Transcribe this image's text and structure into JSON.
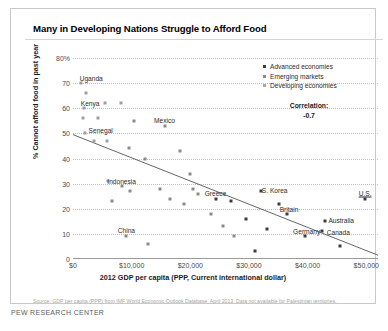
{
  "title": "Many in Developing Nations Struggle to Afford Food",
  "legend": {
    "position": "top-right",
    "items": [
      {
        "key": "adv",
        "label": "Advanced economies"
      },
      {
        "key": "eme",
        "label": "Emerging markets"
      },
      {
        "key": "dev",
        "label": "Developing economies"
      }
    ]
  },
  "annotation": {
    "correlation_label": "Correlation:",
    "correlation_value": "-0.7"
  },
  "source": "Source: GDP per capita (PPP) from IMF World Economic Outlook Database, April 2013. Data not available for Palestinian territories.",
  "footer": "PEW RESEARCH CENTER",
  "colors": {
    "advanced": "#3d3d3d",
    "emerging": "#8a8a8a",
    "developing": "#9e9e9e",
    "gridline": "#c0c0c0",
    "axis": "#9a9a9a",
    "trendline": "#555555",
    "title_text": "#000000",
    "source_text": "#a6a6a6"
  },
  "chart_data": {
    "type": "scatter",
    "title": "Many in Developing Nations Struggle to Afford Food",
    "xlabel": "2012 GDP per capita (PPP, Current international dollar)",
    "ylabel": "% Cannot afford food in past year",
    "xlim": [
      0,
      52000
    ],
    "ylim": [
      0,
      80
    ],
    "grid": true,
    "xticks": [
      0,
      10000,
      20000,
      30000,
      40000,
      50000
    ],
    "xticklabels": [
      "$0",
      "$10,000",
      "$20,000",
      "$30,000",
      "$40,000",
      "$50,000"
    ],
    "yticks": [
      0,
      10,
      20,
      30,
      40,
      50,
      60,
      70,
      80
    ],
    "yticklabels": [
      "0",
      "10",
      "20",
      "30",
      "40",
      "50",
      "60",
      "70",
      "80%"
    ],
    "annotations": [
      {
        "text": "Correlation:",
        "x": 44000,
        "y": 63
      },
      {
        "text": "-0.7",
        "x": 44000,
        "y": 58
      }
    ],
    "trendline": {
      "x0": 0,
      "y0": 49.5,
      "x1": 52000,
      "y1": 1.5,
      "correlation": -0.7
    },
    "series": [
      {
        "name": "Developing economies",
        "color": "#9e9e9e",
        "points": [
          {
            "label": "Uganda",
            "x": 1400,
            "y": 70,
            "label_dx": 10,
            "label_dy": 5
          },
          {
            "label": "",
            "x": 2300,
            "y": 66
          },
          {
            "label": "Kenya",
            "x": 1900,
            "y": 60,
            "label_dx": 6,
            "label_dy": 5
          },
          {
            "label": "",
            "x": 5400,
            "y": 62
          },
          {
            "label": "",
            "x": 8200,
            "y": 62
          },
          {
            "label": "",
            "x": 1700,
            "y": 56
          },
          {
            "label": "",
            "x": 4200,
            "y": 56
          },
          {
            "label": "Senegal",
            "x": 2000,
            "y": 50,
            "label_dx": 16,
            "label_dy": 3
          },
          {
            "label": "",
            "x": 3500,
            "y": 47
          },
          {
            "label": "",
            "x": 5800,
            "y": 47
          },
          {
            "label": "",
            "x": 5900,
            "y": 31
          }
        ]
      },
      {
        "name": "Emerging markets",
        "color": "#8a8a8a",
        "points": [
          {
            "label": "Mexico",
            "x": 15600,
            "y": 53,
            "label_dx": 0,
            "label_dy": 6
          },
          {
            "label": "",
            "x": 10400,
            "y": 55
          },
          {
            "label": "",
            "x": 9500,
            "y": 44
          },
          {
            "label": "",
            "x": 12200,
            "y": 40
          },
          {
            "label": "",
            "x": 18300,
            "y": 43
          },
          {
            "label": "",
            "x": 20000,
            "y": 34
          },
          {
            "label": "Indonesia",
            "x": 8300,
            "y": 29,
            "label_dx": 0,
            "label_dy": 5
          },
          {
            "label": "",
            "x": 9700,
            "y": 27
          },
          {
            "label": "",
            "x": 14800,
            "y": 28
          },
          {
            "label": "",
            "x": 20400,
            "y": 28
          },
          {
            "label": "",
            "x": 21300,
            "y": 26
          },
          {
            "label": "",
            "x": 19000,
            "y": 22
          },
          {
            "label": "",
            "x": 16600,
            "y": 24
          },
          {
            "label": "",
            "x": 6700,
            "y": 23
          },
          {
            "label": "China",
            "x": 9100,
            "y": 9,
            "label_dx": 0,
            "label_dy": 6
          },
          {
            "label": "",
            "x": 12800,
            "y": 6
          },
          {
            "label": "",
            "x": 23500,
            "y": 18
          },
          {
            "label": "",
            "x": 25500,
            "y": 13
          },
          {
            "label": "",
            "x": 27500,
            "y": 9
          }
        ]
      },
      {
        "name": "Advanced economies",
        "color": "#3d3d3d",
        "points": [
          {
            "label": "Greece",
            "x": 24300,
            "y": 24,
            "label_dx": 0,
            "label_dy": 6
          },
          {
            "label": "",
            "x": 27000,
            "y": 23
          },
          {
            "label": "S. Korea",
            "x": 32000,
            "y": 27,
            "label_dx": 14,
            "label_dy": 1
          },
          {
            "label": "Britain",
            "x": 36500,
            "y": 18,
            "label_dx": 2,
            "label_dy": 5
          },
          {
            "label": "",
            "x": 35200,
            "y": 22
          },
          {
            "label": "U.S.",
            "x": 49800,
            "y": 24,
            "label_dx": 0,
            "label_dy": 6
          },
          {
            "label": "Australia",
            "x": 43000,
            "y": 15,
            "label_dx": 16,
            "label_dy": 1
          },
          {
            "label": "Canada",
            "x": 42500,
            "y": 11,
            "label_dx": 16,
            "label_dy": -1
          },
          {
            "label": "Germany",
            "x": 39500,
            "y": 9,
            "label_dx": 2,
            "label_dy": 5
          },
          {
            "label": "",
            "x": 45500,
            "y": 5
          },
          {
            "label": "",
            "x": 33000,
            "y": 12
          },
          {
            "label": "",
            "x": 31000,
            "y": 3
          },
          {
            "label": "",
            "x": 29500,
            "y": 16
          }
        ]
      }
    ]
  }
}
